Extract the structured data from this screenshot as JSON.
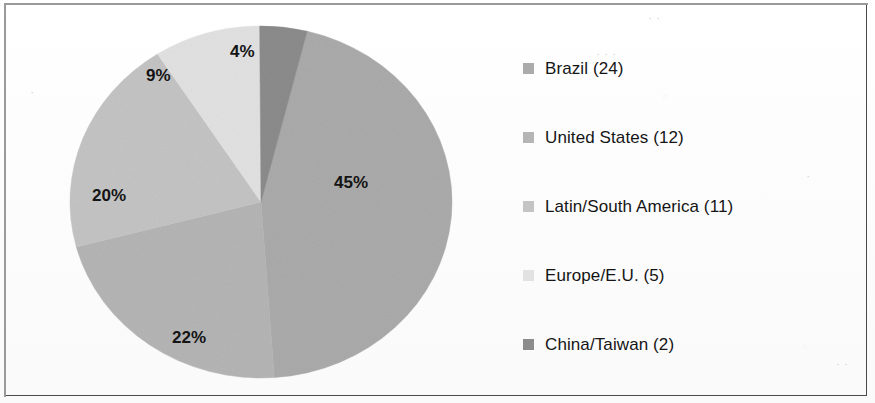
{
  "figure": {
    "background_color": "#fdfdfd",
    "border_color": "#4a4a4a"
  },
  "chart_data": {
    "type": "pie",
    "title": "",
    "legend_position": "right",
    "categories": [
      "Brazil",
      "United States",
      "Latin/South America",
      "Europe/E.U.",
      "China/Taiwan"
    ],
    "values": [
      24,
      12,
      11,
      5,
      2
    ],
    "percentages": [
      45,
      22,
      20,
      9,
      4
    ],
    "percent_labels": [
      "45%",
      "22%",
      "20%",
      "9%",
      "4%"
    ],
    "legend_labels": [
      "Brazil (24)",
      "United States (12)",
      "Latin/South America (11)",
      "Europe/E.U. (5)",
      "China/Taiwan (2)"
    ],
    "colors": [
      "#ababab",
      "#b5b5b5",
      "#c4c4c4",
      "#e2e2e2",
      "#8c8c8c"
    ],
    "start_angle_deg": 14,
    "direction": "clockwise",
    "total": 54
  },
  "slices": [
    {
      "label": "Brazil (24)",
      "percent_label": "45%",
      "count": 24,
      "color": "#ababab"
    },
    {
      "label": "United States (12)",
      "percent_label": "22%",
      "count": 12,
      "color": "#b5b5b5"
    },
    {
      "label": "Latin/South America (11)",
      "percent_label": "20%",
      "count": 11,
      "color": "#c4c4c4"
    },
    {
      "label": "Europe/E.U. (5)",
      "percent_label": "9%",
      "count": 5,
      "color": "#e2e2e2"
    },
    {
      "label": "China/Taiwan (2)",
      "percent_label": "4%",
      "count": 2,
      "color": "#8c8c8c"
    }
  ]
}
